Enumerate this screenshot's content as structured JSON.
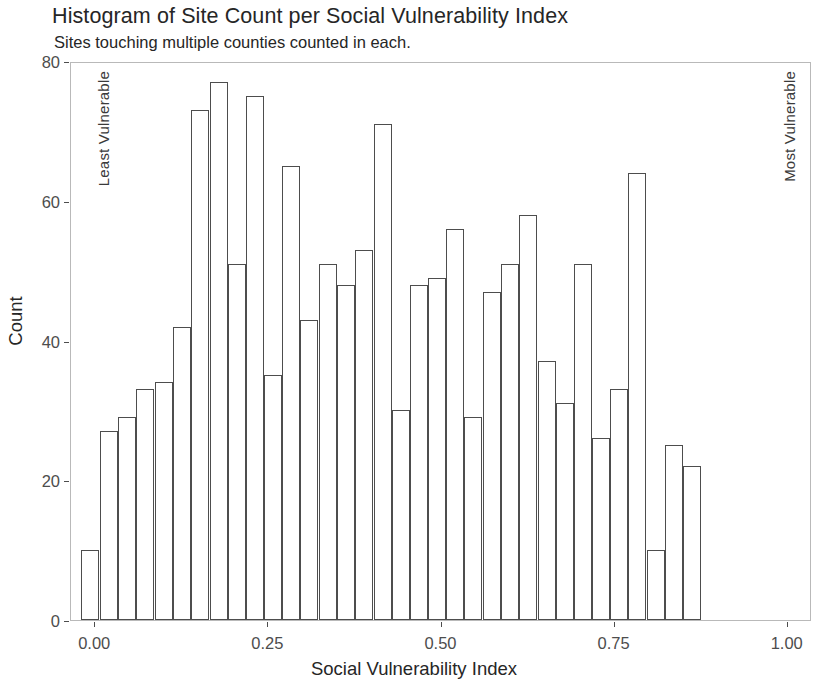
{
  "chart_data": {
    "type": "bar",
    "title": "Histogram of Site Count per Social Vulnerability Index",
    "subtitle": "Sites touching multiple counties counted in each.",
    "xlabel": "Social Vulnerability Index",
    "ylabel": "Count",
    "xlim": [
      -0.035,
      1.035
    ],
    "ylim": [
      0,
      80
    ],
    "grid": false,
    "legend": null,
    "bin_width": 0.026,
    "xticks": [
      {
        "value": 0.0,
        "label": "0.00"
      },
      {
        "value": 0.25,
        "label": "0.25"
      },
      {
        "value": 0.5,
        "label": "0.50"
      },
      {
        "value": 0.75,
        "label": "0.75"
      },
      {
        "value": 1.0,
        "label": "1.00"
      }
    ],
    "yticks": [
      {
        "value": 0,
        "label": "0"
      },
      {
        "value": 20,
        "label": "20"
      },
      {
        "value": 40,
        "label": "40"
      },
      {
        "value": 60,
        "label": "60"
      },
      {
        "value": 80,
        "label": "80"
      }
    ],
    "annotations": [
      {
        "name": "least-vulnerable",
        "text": "Least Vulnerable"
      },
      {
        "name": "most-vulnerable",
        "text": "Most Vulnerable"
      }
    ],
    "bin_centers": [
      -0.007,
      0.02,
      0.046,
      0.072,
      0.099,
      0.125,
      0.151,
      0.178,
      0.204,
      0.23,
      0.257,
      0.283,
      0.309,
      0.336,
      0.362,
      0.388,
      0.415,
      0.441,
      0.467,
      0.494,
      0.52,
      0.546,
      0.573,
      0.599,
      0.625,
      0.652,
      0.678,
      0.704,
      0.731,
      0.757,
      0.783,
      0.81,
      0.836,
      0.862,
      0.889,
      0.915,
      0.941,
      0.968,
      0.994
    ],
    "values": [
      10,
      27,
      29,
      33,
      34,
      42,
      73,
      77,
      51,
      75,
      35,
      65,
      43,
      51,
      48,
      53,
      71,
      30,
      48,
      49,
      56,
      29,
      47,
      51,
      58,
      37,
      31,
      51,
      26,
      33,
      64,
      10,
      25,
      22,
      0,
      0,
      0,
      0,
      0
    ],
    "bars": [
      {
        "x": -0.007,
        "count": 10
      },
      {
        "x": 0.02,
        "count": 27
      },
      {
        "x": 0.046,
        "count": 29
      },
      {
        "x": 0.072,
        "count": 33
      },
      {
        "x": 0.099,
        "count": 34
      },
      {
        "x": 0.125,
        "count": 42
      },
      {
        "x": 0.151,
        "count": 73
      },
      {
        "x": 0.178,
        "count": 77
      },
      {
        "x": 0.204,
        "count": 51
      },
      {
        "x": 0.23,
        "count": 75
      },
      {
        "x": 0.257,
        "count": 35
      },
      {
        "x": 0.283,
        "count": 65
      },
      {
        "x": 0.309,
        "count": 43
      },
      {
        "x": 0.336,
        "count": 51
      },
      {
        "x": 0.362,
        "count": 48
      },
      {
        "x": 0.388,
        "count": 53
      },
      {
        "x": 0.415,
        "count": 71
      },
      {
        "x": 0.441,
        "count": 30
      },
      {
        "x": 0.467,
        "count": 48
      },
      {
        "x": 0.494,
        "count": 49
      },
      {
        "x": 0.52,
        "count": 56
      },
      {
        "x": 0.546,
        "count": 29
      },
      {
        "x": 0.573,
        "count": 47
      },
      {
        "x": 0.599,
        "count": 51
      },
      {
        "x": 0.625,
        "count": 58
      },
      {
        "x": 0.652,
        "count": 37
      },
      {
        "x": 0.678,
        "count": 31
      },
      {
        "x": 0.704,
        "count": 51
      },
      {
        "x": 0.731,
        "count": 26
      },
      {
        "x": 0.757,
        "count": 33
      },
      {
        "x": 0.783,
        "count": 64
      },
      {
        "x": 0.81,
        "count": 10
      },
      {
        "x": 0.836,
        "count": 25
      },
      {
        "x": 0.862,
        "count": 22
      }
    ]
  },
  "colors": {
    "bar_stroke": "#4d4d4d",
    "bar_fill": "#ffffff",
    "panel_border": "#b9b9b9",
    "axis_text": "#4d4d4d",
    "title_text": "#262626",
    "background": "#ffffff"
  }
}
